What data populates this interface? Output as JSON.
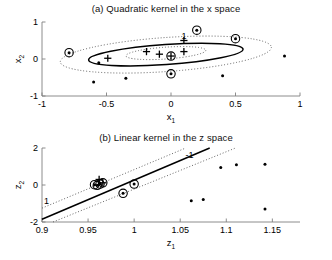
{
  "figure": {
    "panels": [
      {
        "id": "panel-a",
        "title": "(a) Quadratic kernel in the x space",
        "xlabel": "x",
        "xlabel_sub": "1",
        "ylabel": "x",
        "ylabel_sub": "2"
      },
      {
        "id": "panel-b",
        "title": "(b) Linear kernel in the z space",
        "xlabel": "z",
        "xlabel_sub": "1",
        "ylabel": "z",
        "ylabel_sub": "2"
      }
    ],
    "contour_labels": {
      "plus_one": "1",
      "minus_one": "-1"
    },
    "colors": {
      "boundary": "#000000",
      "margin": "#555555",
      "marker": "#000000",
      "axis": "#808080"
    }
  },
  "chart_data": [
    {
      "type": "scatter",
      "id": "panel-a",
      "title": "(a) Quadratic kernel in the x space",
      "xlabel": "x_1",
      "ylabel": "x_2",
      "xlim": [
        -1,
        1
      ],
      "ylim": [
        -1,
        1
      ],
      "xticks": [
        -1,
        -0.5,
        0,
        0.5,
        1
      ],
      "xticklabels": [
        "-1",
        "-0.5",
        "0",
        "0.5",
        "1"
      ],
      "yticks": [
        -1,
        0,
        1
      ],
      "yticklabels": [
        "-1",
        "0",
        "1"
      ],
      "grid": false,
      "legend": "none",
      "series": [
        {
          "name": "class +1 (plus markers)",
          "marker": "plus",
          "points": [
            {
              "x": -0.49,
              "y": 0.02,
              "support": false
            },
            {
              "x": -0.19,
              "y": 0.2,
              "support": false
            },
            {
              "x": -0.09,
              "y": 0.13,
              "support": false
            },
            {
              "x": 0.0,
              "y": 0.08,
              "support": true
            },
            {
              "x": 0.1,
              "y": 0.2,
              "support": false
            },
            {
              "x": 0.1,
              "y": 0.5,
              "support": false
            }
          ]
        },
        {
          "name": "class -1 (dot markers)",
          "marker": "dot",
          "points": [
            {
              "x": -0.79,
              "y": 0.17,
              "support": true
            },
            {
              "x": -0.6,
              "y": -0.62,
              "support": false
            },
            {
              "x": -0.56,
              "y": -0.1,
              "support": false
            },
            {
              "x": -0.35,
              "y": -0.52,
              "support": false
            },
            {
              "x": 0.0,
              "y": -0.4,
              "support": true
            },
            {
              "x": 0.2,
              "y": 0.78,
              "support": true
            },
            {
              "x": 0.4,
              "y": -0.45,
              "support": false
            },
            {
              "x": 0.5,
              "y": 0.55,
              "support": true
            },
            {
              "x": 0.88,
              "y": 0.08,
              "support": false
            }
          ]
        }
      ],
      "decision_boundary": {
        "kind": "ellipse",
        "style": "solid",
        "cx": -0.04,
        "cy": 0.12,
        "rx": 0.6,
        "ry": 0.27,
        "rotation_deg": -4
      },
      "margins": [
        {
          "label": "-1",
          "kind": "ellipse",
          "style": "dotted",
          "cx": -0.04,
          "cy": 0.12,
          "rx": 0.82,
          "ry": 0.46,
          "rotation_deg": -4
        },
        {
          "label": "1",
          "kind": "ellipse",
          "style": "dotted",
          "cx": -0.04,
          "cy": 0.16,
          "rx": 0.31,
          "ry": 0.16,
          "rotation_deg": -4
        }
      ]
    },
    {
      "type": "scatter",
      "id": "panel-b",
      "title": "(b) Linear kernel in the z space",
      "xlabel": "z_1",
      "ylabel": "z_2",
      "xlim": [
        0.9,
        1.18
      ],
      "ylim": [
        -2,
        2
      ],
      "xticks": [
        0.9,
        0.95,
        1.0,
        1.05,
        1.1,
        1.15
      ],
      "xticklabels": [
        "0.9",
        "0.95",
        "1",
        "1.05",
        "1.1",
        "1.15"
      ],
      "yticks": [
        -2,
        0,
        2
      ],
      "yticklabels": [
        "-2",
        "0",
        "2"
      ],
      "grid": false,
      "legend": "none",
      "series": [
        {
          "name": "class +1 (plus markers)",
          "marker": "plus",
          "points": [
            {
              "x": 0.962,
              "y": 0.3,
              "support": false
            },
            {
              "x": 0.966,
              "y": 0.12,
              "support": true
            }
          ]
        },
        {
          "name": "class -1 (dot markers)",
          "marker": "dot",
          "points": [
            {
              "x": 0.957,
              "y": 0.02,
              "support": true
            },
            {
              "x": 0.96,
              "y": -0.02,
              "support": true
            },
            {
              "x": 0.963,
              "y": 0.05,
              "support": true
            },
            {
              "x": 0.988,
              "y": -0.45,
              "support": true
            },
            {
              "x": 1.0,
              "y": 0.05,
              "support": true
            },
            {
              "x": 1.062,
              "y": -0.85,
              "support": false
            },
            {
              "x": 1.075,
              "y": -0.78,
              "support": false
            },
            {
              "x": 1.094,
              "y": 0.95,
              "support": false
            },
            {
              "x": 1.111,
              "y": 1.1,
              "support": false
            },
            {
              "x": 1.142,
              "y": 1.12,
              "support": false
            },
            {
              "x": 1.142,
              "y": -1.3,
              "support": false
            }
          ]
        }
      ],
      "decision_boundary": {
        "kind": "line",
        "style": "solid",
        "p1": {
          "x": 0.9,
          "y": -1.85
        },
        "p2": {
          "x": 1.082,
          "y": 2.0
        }
      },
      "margins": [
        {
          "label": "1",
          "kind": "line",
          "style": "dotted",
          "p1": {
            "x": 0.9,
            "y": -1.25
          },
          "p2": {
            "x": 1.056,
            "y": 2.0
          }
        },
        {
          "label": "-1",
          "kind": "line",
          "style": "dotted",
          "p1": {
            "x": 0.912,
            "y": -2.0
          },
          "p2": {
            "x": 1.11,
            "y": 2.0
          }
        }
      ]
    }
  ]
}
